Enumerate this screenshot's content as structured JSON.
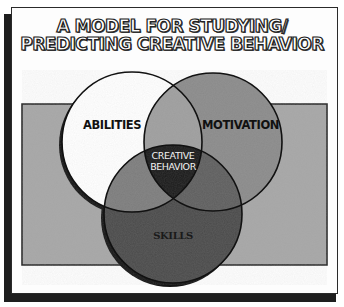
{
  "title": {
    "line1": "A MODEL FOR STUDYING/",
    "line2": "PREDICTING CREATIVE BEHAVIOR"
  },
  "diagram": {
    "type": "venn",
    "sets": [
      {
        "label": "ABILITIES",
        "fill": "#ffffff"
      },
      {
        "label": "MOTIVATION",
        "fill": "#8a8a8a"
      },
      {
        "label": "SKILLS",
        "fill": "#4a4a4a"
      }
    ],
    "center_label_line1": "CREATIVE",
    "center_label_line2": "BEHAVIOR",
    "background_fill": "#a6a6a6",
    "center_fill": "#1a1a1a"
  }
}
